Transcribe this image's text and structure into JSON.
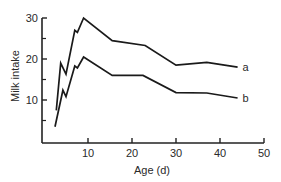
{
  "chart_data": {
    "type": "line",
    "title": "",
    "xlabel": "Age (d)",
    "ylabel": "Milk intake",
    "xlim": [
      0,
      50
    ],
    "ylim": [
      0,
      30
    ],
    "xticks": [
      10,
      20,
      30,
      40,
      50
    ],
    "yticks": [
      10,
      20,
      30
    ],
    "yminor_ticks": [
      5,
      15,
      25
    ],
    "grid": false,
    "legend": "inline labels at line ends",
    "series": [
      {
        "name": "a",
        "points": [
          [
            2.8,
            7.5
          ],
          [
            3.8,
            19
          ],
          [
            5,
            16.3
          ],
          [
            7,
            27
          ],
          [
            7.6,
            26.5
          ],
          [
            9,
            30
          ],
          [
            15.5,
            24.5
          ],
          [
            23,
            23.3
          ],
          [
            30,
            18.5
          ],
          [
            37,
            19.2
          ],
          [
            44,
            18
          ]
        ]
      },
      {
        "name": "b",
        "points": [
          [
            2.5,
            3.5
          ],
          [
            4.3,
            12.4
          ],
          [
            5,
            10.8
          ],
          [
            7,
            18.3
          ],
          [
            7.6,
            17.8
          ],
          [
            9,
            20.5
          ],
          [
            15.5,
            16
          ],
          [
            22.5,
            16
          ],
          [
            30,
            11.8
          ],
          [
            37,
            11.7
          ],
          [
            44,
            10.5
          ]
        ]
      }
    ]
  },
  "plot": {
    "origin_px": [
      44,
      141
    ],
    "px_per_x_unit": 4.4,
    "px_per_y_unit": 4.1,
    "line_color": "#1a1a1a",
    "axis_color": "#222222"
  }
}
